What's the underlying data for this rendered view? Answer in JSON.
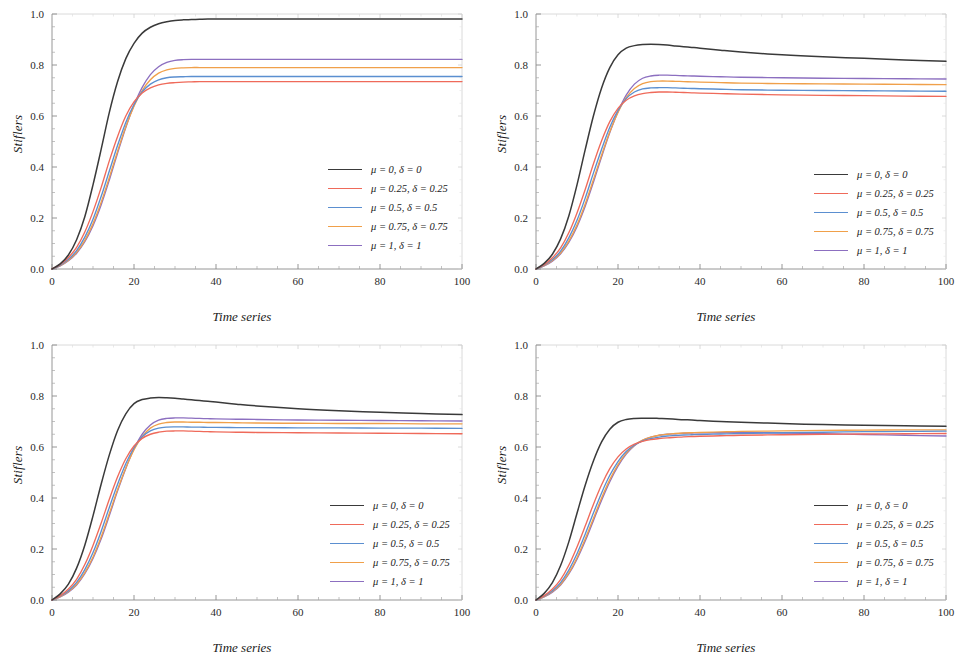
{
  "figure": {
    "layout": "2x2 grid of line charts",
    "panels": [
      "a",
      "b",
      "c",
      "d"
    ]
  },
  "axis": {
    "xlabel": "Time series",
    "ylabel": "Stiflers",
    "xticks": [
      "0",
      "20",
      "40",
      "60",
      "80",
      "100"
    ],
    "yticks": [
      "0.0",
      "0.2",
      "0.4",
      "0.6",
      "0.8",
      "1.0"
    ],
    "xlim": [
      0,
      100
    ],
    "ylim": [
      0,
      1
    ]
  },
  "colors": {
    "series0": "#3a3a3a",
    "series1": "#ef6a5a",
    "series2": "#5b8fd0",
    "series3": "#f0a04a",
    "series4": "#8c6fc0"
  },
  "legend": {
    "position": "inner-right",
    "entries": [
      {
        "label": "μ = 0, δ = 0",
        "color": "#3a3a3a"
      },
      {
        "label": "μ = 0.25, δ = 0.25",
        "color": "#ef6a5a"
      },
      {
        "label": "μ = 0.5, δ = 0.5",
        "color": "#5b8fd0"
      },
      {
        "label": "μ = 0.75, δ = 0.75",
        "color": "#f0a04a"
      },
      {
        "label": "μ = 1, δ = 1",
        "color": "#8c6fc0"
      }
    ]
  },
  "chart_data": [
    {
      "type": "line",
      "panel": "top-left",
      "title": "",
      "xlabel": "Time series",
      "ylabel": "Stiflers",
      "xlim": [
        0,
        100
      ],
      "ylim": [
        0,
        1
      ],
      "grid": false,
      "legend_position": "inner-right",
      "x": [
        0,
        2,
        4,
        6,
        8,
        10,
        12,
        14,
        16,
        18,
        20,
        22,
        24,
        26,
        28,
        30,
        32,
        34,
        36,
        38,
        40,
        45,
        50,
        60,
        70,
        80,
        90,
        100
      ],
      "series": [
        {
          "name": "μ = 0, δ = 0",
          "color": "#3a3a3a",
          "values": [
            0.0,
            0.02,
            0.055,
            0.115,
            0.205,
            0.33,
            0.47,
            0.615,
            0.735,
            0.825,
            0.885,
            0.925,
            0.948,
            0.962,
            0.97,
            0.975,
            0.977,
            0.978,
            0.979,
            0.98,
            0.98,
            0.98,
            0.98,
            0.98,
            0.98,
            0.98,
            0.98,
            0.98
          ]
        },
        {
          "name": "μ = 0.25, δ = 0.25",
          "color": "#ef6a5a",
          "values": [
            0.0,
            0.018,
            0.045,
            0.085,
            0.145,
            0.225,
            0.32,
            0.425,
            0.52,
            0.6,
            0.655,
            0.69,
            0.71,
            0.722,
            0.728,
            0.731,
            0.733,
            0.734,
            0.735,
            0.735,
            0.735,
            0.735,
            0.735,
            0.735,
            0.735,
            0.735,
            0.735,
            0.735
          ]
        },
        {
          "name": "μ = 0.5, δ = 0.5",
          "color": "#5b8fd0",
          "values": [
            0.0,
            0.015,
            0.038,
            0.072,
            0.125,
            0.195,
            0.285,
            0.385,
            0.485,
            0.575,
            0.645,
            0.695,
            0.725,
            0.742,
            0.75,
            0.753,
            0.754,
            0.755,
            0.755,
            0.755,
            0.755,
            0.755,
            0.755,
            0.755,
            0.755,
            0.755,
            0.755,
            0.755
          ]
        },
        {
          "name": "μ = 0.75, δ = 0.75",
          "color": "#f0a04a",
          "values": [
            0.0,
            0.013,
            0.034,
            0.065,
            0.112,
            0.178,
            0.262,
            0.36,
            0.462,
            0.558,
            0.638,
            0.7,
            0.742,
            0.768,
            0.781,
            0.787,
            0.789,
            0.79,
            0.79,
            0.79,
            0.79,
            0.79,
            0.79,
            0.79,
            0.79,
            0.79,
            0.79,
            0.79
          ]
        },
        {
          "name": "μ = 1, δ = 1",
          "color": "#8c6fc0",
          "values": [
            0.0,
            0.012,
            0.032,
            0.062,
            0.107,
            0.17,
            0.252,
            0.35,
            0.455,
            0.555,
            0.642,
            0.712,
            0.762,
            0.793,
            0.81,
            0.818,
            0.821,
            0.822,
            0.822,
            0.822,
            0.822,
            0.822,
            0.822,
            0.822,
            0.822,
            0.822,
            0.822,
            0.822
          ]
        }
      ]
    },
    {
      "type": "line",
      "panel": "top-right",
      "title": "",
      "xlabel": "Time series",
      "ylabel": "Stiflers",
      "xlim": [
        0,
        100
      ],
      "ylim": [
        0,
        1
      ],
      "grid": false,
      "legend_position": "inner-right",
      "x": [
        0,
        2,
        4,
        6,
        8,
        10,
        12,
        14,
        16,
        18,
        20,
        22,
        24,
        26,
        28,
        30,
        32,
        34,
        36,
        38,
        40,
        45,
        50,
        60,
        70,
        80,
        90,
        100
      ],
      "series": [
        {
          "name": "μ = 0, δ = 0",
          "color": "#3a3a3a",
          "values": [
            0.0,
            0.022,
            0.058,
            0.118,
            0.208,
            0.33,
            0.468,
            0.6,
            0.71,
            0.79,
            0.84,
            0.866,
            0.876,
            0.88,
            0.881,
            0.88,
            0.878,
            0.875,
            0.872,
            0.869,
            0.866,
            0.858,
            0.851,
            0.84,
            0.832,
            0.826,
            0.82,
            0.815
          ]
        },
        {
          "name": "μ = 0.25, δ = 0.25",
          "color": "#ef6a5a",
          "values": [
            0.0,
            0.017,
            0.044,
            0.083,
            0.142,
            0.22,
            0.312,
            0.412,
            0.503,
            0.578,
            0.63,
            0.662,
            0.679,
            0.688,
            0.692,
            0.694,
            0.694,
            0.693,
            0.692,
            0.691,
            0.69,
            0.688,
            0.686,
            0.683,
            0.681,
            0.68,
            0.678,
            0.677
          ]
        },
        {
          "name": "μ = 0.5, δ = 0.5",
          "color": "#5b8fd0",
          "values": [
            0.0,
            0.015,
            0.037,
            0.07,
            0.122,
            0.191,
            0.278,
            0.376,
            0.47,
            0.556,
            0.622,
            0.668,
            0.694,
            0.706,
            0.71,
            0.711,
            0.711,
            0.71,
            0.709,
            0.708,
            0.707,
            0.705,
            0.703,
            0.701,
            0.7,
            0.699,
            0.698,
            0.697
          ]
        },
        {
          "name": "μ = 0.75, δ = 0.75",
          "color": "#f0a04a",
          "values": [
            0.0,
            0.013,
            0.033,
            0.063,
            0.109,
            0.173,
            0.255,
            0.35,
            0.447,
            0.538,
            0.614,
            0.672,
            0.708,
            0.727,
            0.735,
            0.737,
            0.737,
            0.736,
            0.735,
            0.734,
            0.733,
            0.731,
            0.729,
            0.727,
            0.726,
            0.725,
            0.724,
            0.723
          ]
        },
        {
          "name": "μ = 1, δ = 1",
          "color": "#8c6fc0",
          "values": [
            0.0,
            0.012,
            0.031,
            0.06,
            0.104,
            0.166,
            0.246,
            0.34,
            0.44,
            0.535,
            0.617,
            0.682,
            0.725,
            0.748,
            0.757,
            0.76,
            0.76,
            0.759,
            0.758,
            0.757,
            0.756,
            0.754,
            0.752,
            0.75,
            0.748,
            0.747,
            0.746,
            0.745
          ]
        }
      ]
    },
    {
      "type": "line",
      "panel": "bottom-left",
      "title": "",
      "xlabel": "Time series",
      "ylabel": "Stiflers",
      "xlim": [
        0,
        100
      ],
      "ylim": [
        0,
        1
      ],
      "grid": false,
      "legend_position": "inner-right",
      "x": [
        0,
        2,
        4,
        6,
        8,
        10,
        12,
        14,
        16,
        18,
        20,
        22,
        24,
        26,
        28,
        30,
        32,
        34,
        36,
        38,
        40,
        45,
        50,
        60,
        70,
        80,
        90,
        100
      ],
      "series": [
        {
          "name": "μ = 0, δ = 0",
          "color": "#3a3a3a",
          "values": [
            0.0,
            0.024,
            0.062,
            0.125,
            0.215,
            0.33,
            0.455,
            0.57,
            0.665,
            0.73,
            0.77,
            0.786,
            0.792,
            0.794,
            0.793,
            0.791,
            0.788,
            0.785,
            0.782,
            0.779,
            0.776,
            0.768,
            0.761,
            0.75,
            0.742,
            0.736,
            0.731,
            0.727
          ]
        },
        {
          "name": "μ = 0.25, δ = 0.25",
          "color": "#ef6a5a",
          "values": [
            0.0,
            0.017,
            0.043,
            0.081,
            0.139,
            0.214,
            0.302,
            0.396,
            0.483,
            0.554,
            0.604,
            0.634,
            0.65,
            0.658,
            0.662,
            0.663,
            0.663,
            0.662,
            0.661,
            0.66,
            0.659,
            0.658,
            0.657,
            0.656,
            0.655,
            0.654,
            0.653,
            0.652
          ]
        },
        {
          "name": "μ = 0.5, δ = 0.5",
          "color": "#5b8fd0",
          "values": [
            0.0,
            0.015,
            0.036,
            0.069,
            0.119,
            0.186,
            0.27,
            0.364,
            0.454,
            0.534,
            0.597,
            0.64,
            0.663,
            0.674,
            0.678,
            0.679,
            0.679,
            0.678,
            0.678,
            0.677,
            0.677,
            0.676,
            0.676,
            0.675,
            0.675,
            0.674,
            0.674,
            0.673
          ]
        },
        {
          "name": "μ = 0.75, δ = 0.75",
          "color": "#f0a04a",
          "values": [
            0.0,
            0.013,
            0.033,
            0.062,
            0.107,
            0.169,
            0.248,
            0.34,
            0.433,
            0.518,
            0.589,
            0.641,
            0.674,
            0.69,
            0.696,
            0.698,
            0.698,
            0.697,
            0.697,
            0.696,
            0.696,
            0.695,
            0.694,
            0.693,
            0.692,
            0.692,
            0.691,
            0.691
          ]
        },
        {
          "name": "μ = 1, δ = 1",
          "color": "#8c6fc0",
          "values": [
            0.0,
            0.012,
            0.031,
            0.059,
            0.103,
            0.163,
            0.24,
            0.332,
            0.428,
            0.516,
            0.592,
            0.65,
            0.686,
            0.705,
            0.712,
            0.714,
            0.714,
            0.713,
            0.712,
            0.711,
            0.71,
            0.709,
            0.708,
            0.706,
            0.705,
            0.704,
            0.703,
            0.702
          ]
        }
      ]
    },
    {
      "type": "line",
      "panel": "bottom-right",
      "title": "",
      "xlabel": "Time series",
      "ylabel": "Stiflers",
      "xlim": [
        0,
        100
      ],
      "ylim": [
        0,
        1
      ],
      "grid": false,
      "legend_position": "inner-right",
      "x": [
        0,
        2,
        4,
        6,
        8,
        10,
        12,
        14,
        16,
        18,
        20,
        22,
        24,
        26,
        28,
        30,
        32,
        34,
        36,
        38,
        40,
        45,
        50,
        60,
        70,
        80,
        90,
        100
      ],
      "series": [
        {
          "name": "μ = 0, δ = 0",
          "color": "#3a3a3a",
          "values": [
            0.0,
            0.026,
            0.068,
            0.135,
            0.228,
            0.34,
            0.45,
            0.545,
            0.62,
            0.67,
            0.697,
            0.708,
            0.712,
            0.713,
            0.713,
            0.712,
            0.711,
            0.709,
            0.707,
            0.706,
            0.704,
            0.7,
            0.697,
            0.692,
            0.688,
            0.685,
            0.683,
            0.681
          ]
        },
        {
          "name": "μ = 0.25, δ = 0.25",
          "color": "#ef6a5a",
          "values": [
            0.0,
            0.017,
            0.043,
            0.08,
            0.136,
            0.208,
            0.29,
            0.375,
            0.452,
            0.515,
            0.561,
            0.592,
            0.611,
            0.622,
            0.629,
            0.633,
            0.636,
            0.638,
            0.64,
            0.641,
            0.642,
            0.644,
            0.646,
            0.648,
            0.65,
            0.651,
            0.652,
            0.653
          ]
        },
        {
          "name": "μ = 0.5, δ = 0.5",
          "color": "#5b8fd0",
          "values": [
            0.0,
            0.015,
            0.036,
            0.068,
            0.117,
            0.181,
            0.258,
            0.341,
            0.42,
            0.489,
            0.543,
            0.582,
            0.608,
            0.624,
            0.633,
            0.639,
            0.643,
            0.645,
            0.647,
            0.648,
            0.649,
            0.651,
            0.653,
            0.656,
            0.658,
            0.66,
            0.661,
            0.662
          ]
        },
        {
          "name": "μ = 0.75, δ = 0.75",
          "color": "#f0a04a",
          "values": [
            0.0,
            0.013,
            0.033,
            0.062,
            0.106,
            0.166,
            0.239,
            0.32,
            0.4,
            0.472,
            0.531,
            0.576,
            0.607,
            0.627,
            0.639,
            0.646,
            0.65,
            0.653,
            0.655,
            0.656,
            0.657,
            0.659,
            0.661,
            0.663,
            0.665,
            0.666,
            0.667,
            0.667
          ]
        },
        {
          "name": "μ = 1, δ = 1",
          "color": "#8c6fc0",
          "values": [
            0.0,
            0.012,
            0.031,
            0.059,
            0.102,
            0.16,
            0.231,
            0.311,
            0.391,
            0.464,
            0.525,
            0.572,
            0.605,
            0.626,
            0.639,
            0.646,
            0.65,
            0.652,
            0.654,
            0.655,
            0.656,
            0.656,
            0.657,
            0.655,
            0.652,
            0.649,
            0.646,
            0.643
          ]
        }
      ]
    }
  ]
}
